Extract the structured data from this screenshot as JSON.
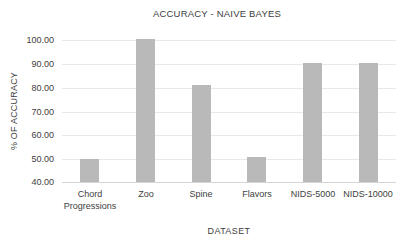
{
  "chart_data": {
    "type": "bar",
    "title": "ACCURACY - NAIVE BAYES",
    "xlabel": "DATASET",
    "ylabel": "% OF ACCURACY",
    "categories": [
      "Chord Progressions",
      "Zoo",
      "Spine",
      "Flavors",
      "NIDS-5000",
      "NIDS-10000"
    ],
    "values": [
      49.5,
      100,
      80.5,
      50.5,
      90,
      90
    ],
    "ylim": [
      40,
      100
    ],
    "yticks": [
      40,
      50,
      60,
      70,
      80,
      90,
      100
    ],
    "ytick_decimals": 2,
    "grid": true,
    "legend": "none",
    "colors": {
      "bar": "#b9b9b9",
      "gridline": "#e8e8e8",
      "baseline": "#d6d6d6",
      "text": "#404040",
      "background": "#ffffff"
    }
  }
}
